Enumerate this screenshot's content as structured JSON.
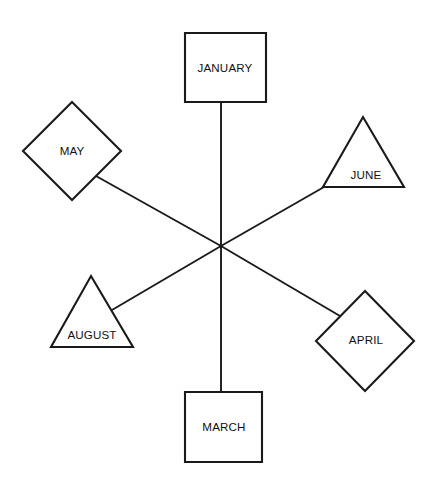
{
  "diagram": {
    "background_color": "#ffffff",
    "stroke_color": "#1a1a1a",
    "fill_color": "#ffffff",
    "text_color": "#111111",
    "hub": {
      "x": 221,
      "y": 246,
      "label": ""
    },
    "nodes": [
      {
        "id": "january",
        "label": "JANUARY",
        "shape": "square",
        "points": "185,33 266,33 266,102 185,102",
        "label_x": 225,
        "label_y": 69,
        "anchor_x": 221,
        "anchor_y": 102
      },
      {
        "id": "may",
        "label": "MAY",
        "shape": "diamond",
        "points": "72,102 121,151 72,200 23,151",
        "label_x": 72,
        "label_y": 152,
        "anchor_x": 96,
        "anchor_y": 176
      },
      {
        "id": "june",
        "label": "JUNE",
        "shape": "triangle",
        "points": "363,117 404,187 323,187",
        "label_x": 366,
        "label_y": 176,
        "anchor_x": 324,
        "anchor_y": 187
      },
      {
        "id": "august",
        "label": "AUGUST",
        "shape": "triangle",
        "points": "91,276 133,347 51,347",
        "label_x": 92,
        "label_y": 336,
        "anchor_x": 112,
        "anchor_y": 310
      },
      {
        "id": "april",
        "label": "APRIL",
        "shape": "diamond",
        "points": "365,291 414,341 365,391 316,341",
        "label_x": 366,
        "label_y": 341,
        "anchor_x": 340,
        "anchor_y": 316
      },
      {
        "id": "march",
        "label": "MARCH",
        "shape": "square",
        "points": "185,392 262,392 262,462 185,462",
        "label_x": 224,
        "label_y": 428,
        "anchor_x": 221,
        "anchor_y": 392
      }
    ],
    "edges": [
      {
        "id": "edge-january-hub",
        "from": "january",
        "to": "hub",
        "x1": 221,
        "y1": 102,
        "x2": 221,
        "y2": 246
      },
      {
        "id": "edge-may-hub",
        "from": "may",
        "to": "hub",
        "x1": 96,
        "y1": 176,
        "x2": 221,
        "y2": 246
      },
      {
        "id": "edge-june-hub",
        "from": "june",
        "to": "hub",
        "x1": 324,
        "y1": 187,
        "x2": 221,
        "y2": 246
      },
      {
        "id": "edge-august-hub",
        "from": "august",
        "to": "hub",
        "x1": 112,
        "y1": 310,
        "x2": 221,
        "y2": 246
      },
      {
        "id": "edge-april-hub",
        "from": "april",
        "to": "hub",
        "x1": 340,
        "y1": 316,
        "x2": 221,
        "y2": 246
      },
      {
        "id": "edge-march-hub",
        "from": "march",
        "to": "hub",
        "x1": 221,
        "y1": 392,
        "x2": 221,
        "y2": 246
      }
    ]
  }
}
